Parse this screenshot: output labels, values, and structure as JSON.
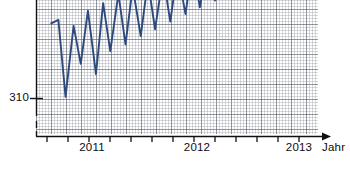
{
  "chart_data": {
    "type": "line",
    "title": "",
    "subtitle": "",
    "xlabel": "Jahr",
    "ylabel": "",
    "grid": true,
    "grid_style": "graph-paper",
    "legend": "none",
    "cropped_top": true,
    "note": "Seasonal monthly oscillation with rising trend; upper peaks are cut off by the image crop.",
    "line_color": "#2e4a7d",
    "axis_color": "#111111",
    "x_axis": {
      "label": "Jahr",
      "tick_labels": [
        "2011",
        "2012",
        "2013"
      ],
      "tick_label_positions_year": [
        2011,
        2012,
        2013
      ],
      "minor_ticks_per_year": 4,
      "range": [
        2010.25,
        2013.4
      ],
      "arrow": true
    },
    "y_axis": {
      "tick_labels": [
        "310"
      ],
      "tick_values": [
        310
      ],
      "visible_range": [
        305.5,
        330
      ],
      "broken_axis": true
    },
    "series": [
      {
        "name": "Messwerte",
        "x": [
          2010.42,
          2010.5,
          2010.58,
          2010.67,
          2010.75,
          2010.83,
          2010.92,
          2011.0,
          2011.08,
          2011.17,
          2011.25,
          2011.33,
          2011.42,
          2011.5,
          2011.58,
          2011.67,
          2011.75,
          2011.83,
          2011.92,
          2012.0,
          2012.08,
          2012.17,
          2012.25,
          2012.33,
          2012.42,
          2012.5,
          2012.58,
          2012.67,
          2012.75,
          2012.83
        ],
        "values": [
          318.9,
          319.3,
          310.2,
          318.6,
          314.1,
          320.4,
          312.9,
          321.3,
          315.6,
          322.4,
          316.4,
          323.2,
          317.4,
          323.9,
          318.2,
          324.6,
          319.1,
          325.2,
          320.0,
          325.9,
          320.8,
          326.4,
          321.6,
          327.0,
          322.3,
          327.6,
          323.0,
          328.1,
          323.7,
          328.6
        ]
      }
    ]
  },
  "axis_labels": {
    "y_310": "310",
    "x_2011": "2011",
    "x_2012": "2012",
    "x_2013": "2013",
    "x_title": "Jahr"
  }
}
